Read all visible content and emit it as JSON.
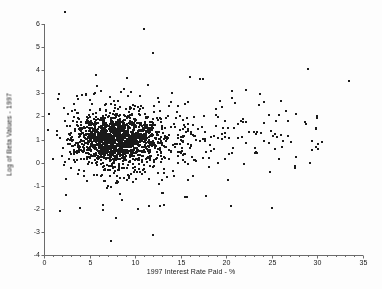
{
  "chart_data": {
    "type": "scatter",
    "title": "",
    "xlabel": "1997 Interest Rate Paid - %",
    "ylabel": "Log of Beta Values - 1997",
    "xlim": [
      0,
      35
    ],
    "ylim": [
      -4,
      6.6
    ],
    "xticks": [
      0,
      5,
      10,
      15,
      20,
      25,
      30,
      35
    ],
    "yticks": [
      -4,
      -3,
      -2,
      -1,
      0,
      1,
      2,
      3,
      4,
      5,
      6
    ],
    "xtick_labels": [
      "0",
      "5",
      "10",
      "15",
      "20",
      "25",
      "30",
      "35"
    ],
    "ytick_labels": [
      "-4",
      "-3",
      "-2",
      "-1",
      "0",
      "1",
      "2",
      "3",
      "4",
      "5",
      "6"
    ],
    "grid": false,
    "legend": false,
    "marker": "square",
    "marker_size_px": 2,
    "marker_color": "#1a1a1a",
    "axis_color": "#6b6b6b",
    "background_color": "#fdfdfd",
    "n_points": 1760,
    "cluster": {
      "x_center": 8.0,
      "y_center": 1.0,
      "x_spread": 2.2,
      "y_spread": 0.55,
      "n": 1200
    },
    "halo": {
      "x_center": 9.0,
      "y_center": 1.0,
      "x_spread": 4.2,
      "y_spread": 0.95,
      "n": 420
    },
    "right_tail": {
      "x_min": 15.0,
      "x_max": 30.5,
      "y_center": 1.1,
      "y_spread": 0.8,
      "n": 120
    },
    "outliers_high": [
      [
        2.3,
        6.5
      ],
      [
        11.0,
        5.8
      ],
      [
        12.0,
        4.75
      ],
      [
        29.0,
        4.05
      ],
      [
        9.1,
        3.65
      ],
      [
        16.0,
        3.7
      ],
      [
        17.1,
        3.6
      ],
      [
        17.4,
        3.6
      ],
      [
        33.5,
        3.55
      ],
      [
        8.8,
        3.2
      ],
      [
        14.0,
        3.0
      ],
      [
        22.2,
        3.15
      ],
      [
        20.6,
        3.1
      ],
      [
        9.5,
        3.05
      ],
      [
        3.6,
        2.9
      ],
      [
        5.5,
        2.95
      ],
      [
        7.2,
        2.85
      ],
      [
        10.5,
        2.9
      ],
      [
        12.5,
        2.8
      ],
      [
        23.6,
        2.5
      ],
      [
        26.5,
        2.25
      ],
      [
        27.6,
        2.1
      ],
      [
        30.0,
        2.0
      ],
      [
        21.0,
        2.6
      ]
    ],
    "outliers_low": [
      [
        7.4,
        -3.4
      ],
      [
        12.0,
        -3.15
      ],
      [
        1.8,
        -2.1
      ],
      [
        4.0,
        -1.95
      ],
      [
        6.5,
        -1.85
      ],
      [
        6.5,
        -2.05
      ],
      [
        10.3,
        -2.0
      ],
      [
        11.5,
        -1.9
      ],
      [
        13.2,
        -1.85
      ],
      [
        20.5,
        -1.9
      ],
      [
        25.0,
        -1.95
      ],
      [
        8.6,
        -1.6
      ],
      [
        2.4,
        -1.4
      ],
      [
        15.5,
        -1.5
      ],
      [
        17.8,
        -1.45
      ]
    ]
  }
}
